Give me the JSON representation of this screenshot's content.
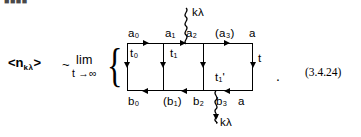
{
  "figure": {
    "top_fragment": "■■■■",
    "lhs": {
      "open_angle": "<",
      "symbol": "n",
      "subscript": "kλ",
      "close_angle": ">",
      "relation": "~"
    },
    "limit": {
      "operator": "lim",
      "under": "t →∞"
    },
    "brace": "{",
    "trailing_period": ".",
    "equation_number": "(3.4.24)"
  },
  "diagram": {
    "top_vertex_labels": [
      "a₀",
      "a₁",
      "a₂",
      "(a₃)",
      "a"
    ],
    "bottom_vertex_labels": [
      "b₀",
      "(b₁)",
      "b₂",
      "b₃",
      "a"
    ],
    "time_labels": {
      "t0": "t₀",
      "t1": "t₁",
      "t1_prime": "t₁'",
      "t_right": "t"
    },
    "photon_lines": [
      {
        "position": "top",
        "label": "kλ",
        "direction": "incoming"
      },
      {
        "position": "bottom",
        "label": "kλ",
        "direction": "outgoing"
      }
    ],
    "line_colors": {
      "stroke": "#000000",
      "background": "#ffffff"
    }
  }
}
